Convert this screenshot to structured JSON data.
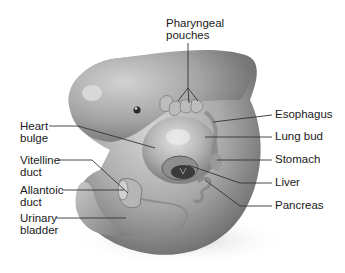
{
  "figure": {
    "colors": {
      "background": "#ffffff",
      "body": "#a8a8a8",
      "shadow": "#555555",
      "leader_line": "#333333",
      "text": "#1a1a1a"
    }
  },
  "labels": {
    "pharyngeal_pouches": {
      "line1": "Pharyngeal",
      "line2": "pouches"
    },
    "heart_bulge": {
      "line1": "Heart",
      "line2": "bulge"
    },
    "vitelline_duct": {
      "line1": "Vitelline",
      "line2": "duct"
    },
    "allantoic_duct": {
      "line1": "Allantoic",
      "line2": "duct"
    },
    "urinary_bladder": {
      "line1": "Urinary",
      "line2": "bladder"
    },
    "esophagus": {
      "line1": "Esophagus"
    },
    "lung_bud": {
      "line1": "Lung bud"
    },
    "stomach": {
      "line1": "Stomach"
    },
    "liver": {
      "line1": "Liver"
    },
    "pancreas": {
      "line1": "Pancreas"
    }
  }
}
